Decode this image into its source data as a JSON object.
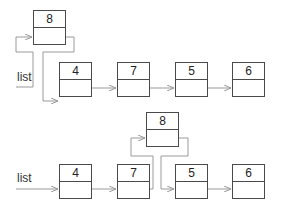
{
  "diagram": {
    "colors": {
      "box_stroke": "#4a4a4a",
      "connector": "#999999",
      "dot": "#4a4a4a",
      "text": "#222222"
    },
    "stage1": {
      "list_label": "list",
      "new_node": {
        "value": "8"
      },
      "nodes": [
        {
          "value": "4"
        },
        {
          "value": "7"
        },
        {
          "value": "5"
        },
        {
          "value": "6"
        }
      ]
    },
    "stage2": {
      "list_label": "list",
      "inserted_node": {
        "value": "8"
      },
      "nodes": [
        {
          "value": "4"
        },
        {
          "value": "7"
        },
        {
          "value": "5"
        },
        {
          "value": "6"
        }
      ]
    }
  }
}
